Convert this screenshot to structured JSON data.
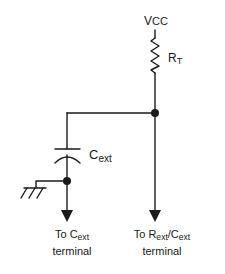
{
  "diagram": {
    "type": "circuit-schematic",
    "stroke_color": "#1a1a1a",
    "labels": {
      "supply": {
        "main": "V",
        "sub": "CC"
      },
      "resistor": {
        "main": "R",
        "sub": "T"
      },
      "capacitor": {
        "main": "C",
        "sub": "ext"
      },
      "left_terminal": {
        "prefix": "To C",
        "sub": "ext",
        "line2": "terminal"
      },
      "right_terminal": {
        "prefix": "To R",
        "sub1": "ext",
        "mid": "/C",
        "sub2": "ext",
        "line2": "terminal"
      }
    },
    "components": [
      {
        "id": "vcc",
        "kind": "supply",
        "label": "VCC"
      },
      {
        "id": "rt",
        "kind": "resistor",
        "label": "RT"
      },
      {
        "id": "cext",
        "kind": "capacitor",
        "label": "Cext"
      },
      {
        "id": "gnd",
        "kind": "ground"
      },
      {
        "id": "j1",
        "kind": "junction"
      },
      {
        "id": "j2",
        "kind": "junction"
      }
    ]
  }
}
